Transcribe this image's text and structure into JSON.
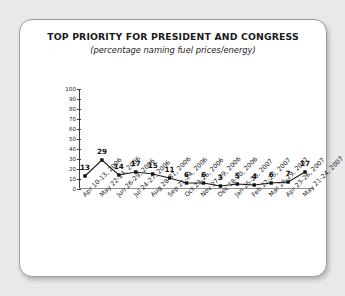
{
  "chart_data": {
    "type": "line",
    "title": "TOP PRIORITY FOR PRESIDENT AND CONGRESS",
    "subtitle": "(percentage naming fuel prices/energy)",
    "xlabel": "",
    "ylabel": "",
    "ylim": [
      0,
      100
    ],
    "yticks": [
      0,
      10,
      20,
      30,
      40,
      50,
      60,
      70,
      80,
      90,
      100
    ],
    "grid": false,
    "legend": null,
    "marker": "square",
    "categories": [
      "Apr 10-13, 2006",
      "May 22-24, 2006",
      "Jun 26-29, 2006",
      "Jul 24-27, 2006",
      "Aug 28-31, 2006",
      "Sep 21-24, 2006",
      "Oct 23-26, 2006",
      "Nov 27-29, 2006",
      "Dec 18-20, 2006",
      "Jan 25-28, 2007",
      "Feb 22-25, 2007",
      "Mar 26-29, 2007",
      "Apr 23-26, 2007",
      "May 21-24, 2007"
    ],
    "values": [
      13,
      29,
      14,
      17,
      15,
      11,
      6,
      6,
      3,
      5,
      4,
      6,
      7,
      17
    ],
    "colors": {
      "line": "#1a1a1a",
      "marker": "#111111",
      "axis": "#3a3a3a",
      "card_border": "#9a9a9a",
      "card_background": "#ffffff",
      "page_background": "#e9e9e9",
      "text": "#1a1a1a"
    }
  }
}
